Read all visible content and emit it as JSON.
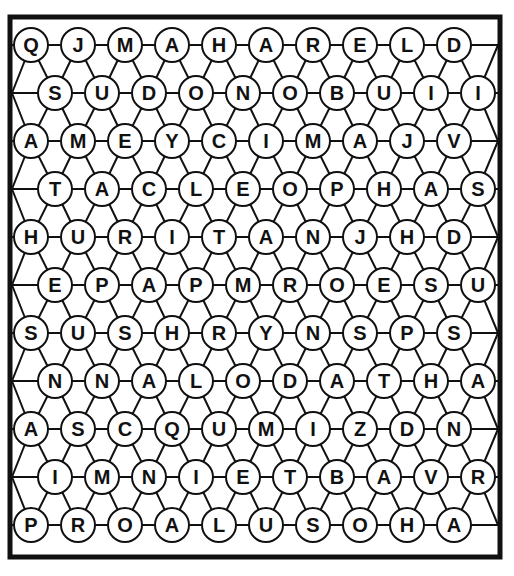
{
  "puzzle": {
    "type": "hexagonal-word-search",
    "grid": [
      [
        "Q",
        "J",
        "M",
        "A",
        "H",
        "A",
        "R",
        "E",
        "L",
        "D"
      ],
      [
        "S",
        "U",
        "D",
        "O",
        "N",
        "O",
        "B",
        "U",
        "I",
        "I"
      ],
      [
        "A",
        "M",
        "E",
        "Y",
        "C",
        "I",
        "M",
        "A",
        "J",
        "V"
      ],
      [
        "T",
        "A",
        "C",
        "L",
        "E",
        "O",
        "P",
        "H",
        "A",
        "S"
      ],
      [
        "H",
        "U",
        "R",
        "I",
        "T",
        "A",
        "N",
        "J",
        "H",
        "D"
      ],
      [
        "E",
        "P",
        "A",
        "P",
        "M",
        "R",
        "O",
        "E",
        "S",
        "U"
      ],
      [
        "S",
        "U",
        "S",
        "H",
        "R",
        "Y",
        "N",
        "S",
        "P",
        "S"
      ],
      [
        "N",
        "N",
        "A",
        "L",
        "O",
        "D",
        "A",
        "T",
        "H",
        "A"
      ],
      [
        "A",
        "S",
        "C",
        "Q",
        "U",
        "M",
        "I",
        "Z",
        "D",
        "N"
      ],
      [
        "I",
        "M",
        "N",
        "I",
        "E",
        "T",
        "B",
        "A",
        "V",
        "R"
      ],
      [
        "P",
        "R",
        "O",
        "A",
        "L",
        "U",
        "S",
        "O",
        "H",
        "A"
      ]
    ]
  },
  "colors": {
    "ink": "#111111",
    "paper": "#ffffff"
  }
}
